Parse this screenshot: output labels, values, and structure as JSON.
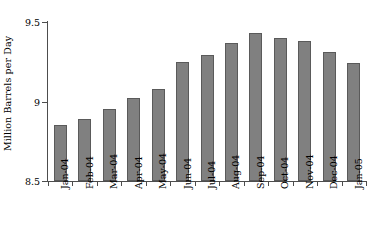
{
  "chart_data": {
    "type": "bar",
    "title": "",
    "xlabel": "",
    "ylabel": "Million Barrels per Day",
    "categories": [
      "Jan-04",
      "Feb-04",
      "Mar-04",
      "Apr-04",
      "May-04",
      "Jun-04",
      "Jul-04",
      "Aug-04",
      "Sep-04",
      "Oct-04",
      "Nov-04",
      "Dec-04",
      "Jan-05"
    ],
    "values": [
      8.85,
      8.89,
      8.95,
      9.02,
      9.08,
      9.25,
      9.29,
      9.37,
      9.43,
      9.4,
      9.38,
      9.31,
      9.24
    ],
    "ylim": [
      8.5,
      9.5
    ],
    "yticks": [
      8.5,
      9.0,
      9.5
    ],
    "ytick_labels": [
      "8.5",
      "9",
      "9.5"
    ],
    "grid": false,
    "legend": null,
    "bar_color": "#808080",
    "bar_edge_color": "#5a5a5a",
    "axis_color": "#4d4d4d",
    "background_color": "#ffffff"
  }
}
